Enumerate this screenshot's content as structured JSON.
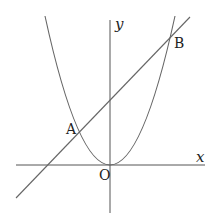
{
  "diagram": {
    "type": "coordinate-graph",
    "axes": {
      "x_label": "x",
      "y_label": "y",
      "origin_label": "O"
    },
    "points": [
      {
        "label": "A",
        "role": "left intersection of line and parabola"
      },
      {
        "label": "B",
        "role": "right intersection of line and parabola"
      }
    ],
    "curves": [
      {
        "name": "parabola",
        "shape": "upward parabola with vertex at O"
      },
      {
        "name": "line",
        "shape": "positive slope, positive y-intercept"
      }
    ],
    "colors": {
      "axis": "#555555",
      "curve": "#666666",
      "text": "#222222"
    }
  }
}
